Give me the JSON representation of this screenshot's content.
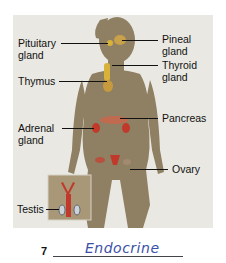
{
  "diagram": {
    "labels": {
      "pituitary": "Pituitary gland",
      "pituitary_l1": "Pituitary",
      "pituitary_l2": "gland",
      "pineal_l1": "Pineal",
      "pineal_l2": "gland",
      "thyroid_l1": "Thyroid",
      "thyroid_l2": "gland",
      "thymus": "Thymus",
      "pancreas": "Pancreas",
      "adrenal_l1": "Adrenal",
      "adrenal_l2": "gland",
      "ovary": "Ovary",
      "testis": "Testis"
    },
    "colors": {
      "background": "#e9e8e2",
      "silhouette": "#8f7f63",
      "gland_red": "#c0392b",
      "gland_yellow": "#d9b23a"
    }
  },
  "question": {
    "number": "7",
    "answer": "Endocrine"
  }
}
